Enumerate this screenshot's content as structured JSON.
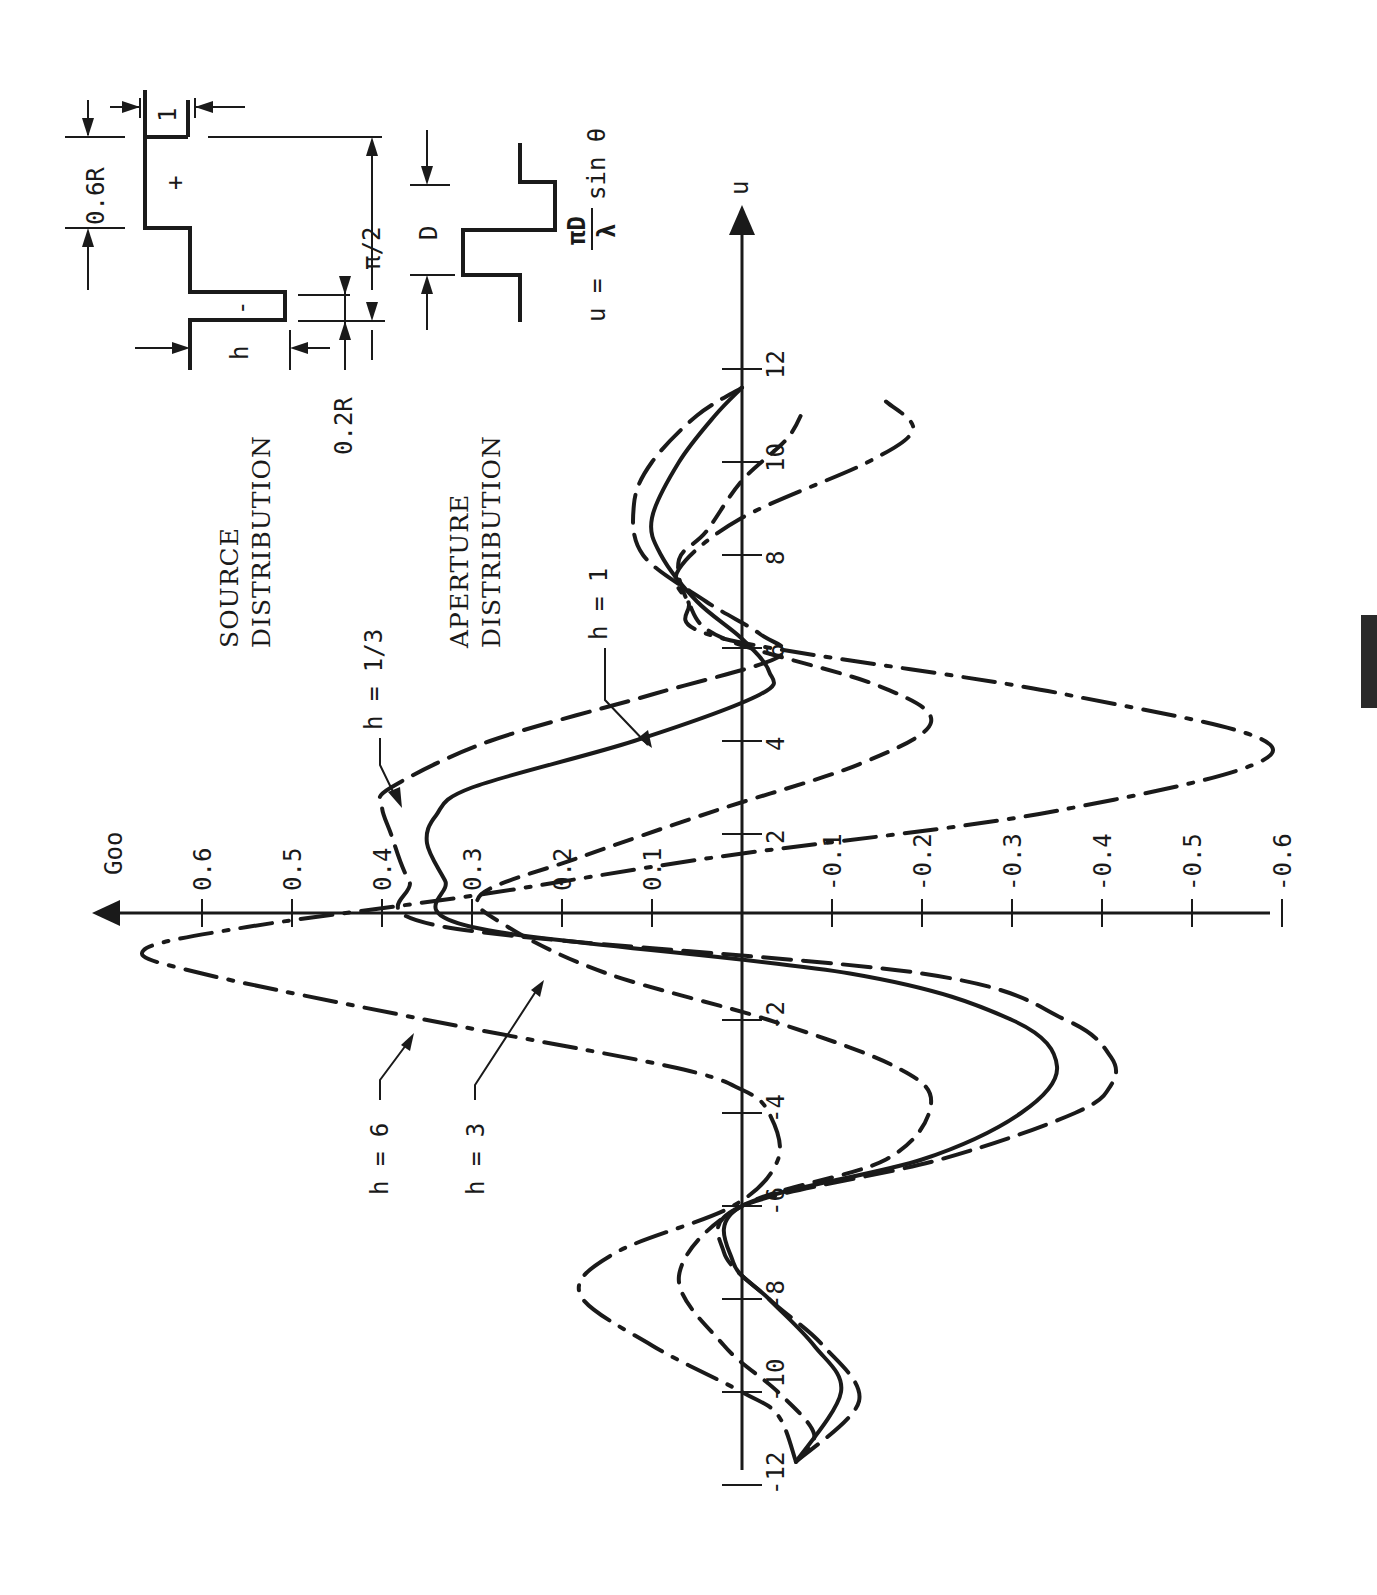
{
  "figure": {
    "source_title": "SOURCE DISTRIBUTION",
    "source_title_lines": [
      "SOURCE",
      "DISTRIBUTION"
    ],
    "aperture_title_lines": [
      "APERTURE",
      "DISTRIBUTION"
    ],
    "source_diagram": {
      "labels": {
        "width_top": "1",
        "top_height": "0.6R",
        "plus": "+",
        "minus": "-",
        "neg_height": "h",
        "neg_width": "0.2R",
        "span": "π/2"
      }
    },
    "aperture_diagram": {
      "labels": {
        "width": "D"
      }
    },
    "formula": "u = (πD/λ) sin θ",
    "formula_parts": {
      "lhs": "u =",
      "num": "πD",
      "den": "λ",
      "rhs": "sin θ"
    }
  },
  "chart_data": {
    "type": "line",
    "title": "",
    "orientation": "rotated 90° counter-clockwise (u axis vertical, G axis horizontal)",
    "xlabel": "u",
    "ylabel": "Goo",
    "xlim": [
      -12,
      12
    ],
    "ylim": [
      -0.6,
      0.6
    ],
    "x_ticks": [
      -12,
      -10,
      -8,
      -6,
      -4,
      -2,
      2,
      4,
      6,
      8,
      10,
      12
    ],
    "y_ticks": [
      0.6,
      0.5,
      0.4,
      0.3,
      0.2,
      0.1,
      -0.1,
      -0.2,
      -0.3,
      -0.4,
      -0.5,
      -0.6
    ],
    "x_tick_labels": [
      "-12",
      "-10",
      "-8",
      "-6",
      "-4",
      "-2",
      "2",
      "4",
      "6",
      "8",
      "10",
      "12"
    ],
    "y_tick_labels": [
      "0.6",
      "0.5",
      "0.4",
      "0.3",
      "0.2",
      "0.1",
      "-0.1",
      "-0.2",
      "-0.3",
      "-0.4",
      "-0.5",
      "-0.6"
    ],
    "grid": false,
    "legend": "inline callout labels with arrows",
    "series": [
      {
        "name": "h = 1/3",
        "style": "long dash",
        "x": [
          -11.5,
          -10.2,
          -9,
          -8,
          -7,
          -6,
          -5,
          -4,
          -3.4,
          -2.8,
          -2,
          -1,
          0,
          1,
          2,
          2.6,
          3,
          4,
          5,
          5.8,
          6.3,
          7,
          8,
          9.1,
          10,
          11,
          11.6
        ],
        "values": [
          -0.06,
          -0.13,
          -0.09,
          -0.03,
          0.02,
          0.0,
          -0.22,
          -0.37,
          -0.41,
          -0.41,
          -0.36,
          -0.2,
          0.33,
          0.37,
          0.39,
          0.4,
          0.39,
          0.28,
          0.1,
          -0.04,
          -0.02,
          0.04,
          0.11,
          0.12,
          0.1,
          0.05,
          0.0
        ]
      },
      {
        "name": "h = 1",
        "style": "solid",
        "x": [
          -11.5,
          -10,
          -9,
          -8,
          -7.2,
          -6,
          -5,
          -4,
          -3,
          -2,
          -1,
          0,
          1,
          1.8,
          2.4,
          3,
          4,
          5,
          5.5,
          6.2,
          7,
          8,
          8.8,
          10,
          11,
          11.6
        ],
        "values": [
          -0.06,
          -0.11,
          -0.08,
          -0.03,
          0.01,
          0.0,
          -0.2,
          -0.31,
          -0.35,
          -0.3,
          -0.12,
          0.3,
          0.33,
          0.35,
          0.34,
          0.3,
          0.12,
          -0.02,
          -0.03,
          0.0,
          0.05,
          0.09,
          0.1,
          0.07,
          0.03,
          0.0
        ]
      },
      {
        "name": "h = 3",
        "style": "short dash",
        "x": [
          -11.5,
          -10.9,
          -10,
          -9,
          -7.5,
          -6,
          -5,
          -3.8,
          -3,
          -2,
          -1,
          0,
          0.7,
          1.5,
          2.5,
          3.5,
          4.4,
          5.2,
          6.2,
          7,
          7.9,
          8.5,
          9.6,
          10.5,
          11.2
        ],
        "values": [
          -0.06,
          -0.08,
          -0.04,
          0.02,
          0.07,
          0.0,
          -0.16,
          -0.21,
          -0.17,
          -0.03,
          0.15,
          0.26,
          0.29,
          0.18,
          0.03,
          -0.13,
          -0.21,
          -0.15,
          0.02,
          0.06,
          0.07,
          0.04,
          0.0,
          -0.05,
          -0.07
        ]
      },
      {
        "name": "h = 6",
        "style": "dash-dot",
        "x": [
          -11.5,
          -10.5,
          -10,
          -9,
          -7.9,
          -7,
          -6,
          -5,
          -4,
          -3.5,
          -3,
          -2,
          -1,
          -0.5,
          0,
          0.7,
          1.5,
          2.5,
          3.8,
          5,
          6.2,
          7,
          7.7,
          8.8,
          10,
          10.7,
          11.3
        ],
        "values": [
          -0.06,
          -0.04,
          0.0,
          0.1,
          0.18,
          0.14,
          0.01,
          -0.04,
          -0.03,
          0.0,
          0.08,
          0.35,
          0.6,
          0.665,
          0.55,
          0.29,
          0.03,
          -0.35,
          -0.59,
          -0.36,
          0.02,
          0.06,
          0.07,
          0.0,
          -0.14,
          -0.19,
          -0.16
        ]
      }
    ],
    "annotations": [
      "h = 1/3",
      "h = 1",
      "h = 3",
      "h = 6",
      "SOURCE DISTRIBUTION",
      "APERTURE DISTRIBUTION",
      "u = (πD/λ) sin θ"
    ]
  }
}
